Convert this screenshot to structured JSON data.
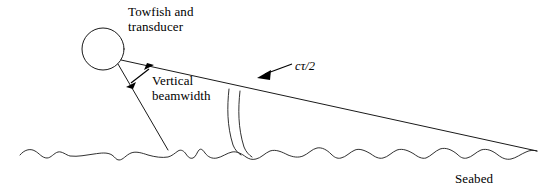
{
  "diagram": {
    "background_color": "#ffffff",
    "stroke_color": "#1a1a1a",
    "labels": {
      "towfish": "Towfish and\ntransducer",
      "beamwidth": "Vertical\nbeamwidth",
      "pulse": "cτ/2",
      "seabed": "Seabed"
    },
    "elements": {
      "towfish_body": "towfish-circle",
      "upper_beam": "upper-beam-ray",
      "lower_beam": "lower-beam-ray",
      "beamwidth_arrow": "vertical-beamwidth-double-arrow",
      "pulse_arcs": "pulse-annulus-arcs",
      "pulse_leader": "pulse-leader-arrow",
      "seabed_profile": "seabed-wavy-line"
    }
  }
}
